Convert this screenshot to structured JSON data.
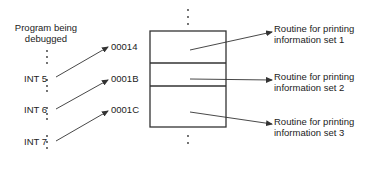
{
  "diagram": {
    "program_label": [
      "Program being",
      "debugged"
    ],
    "interrupts": [
      {
        "label": "INT 5",
        "vector_address": "00014",
        "routine": [
          "Routine for printing",
          "information set 1"
        ]
      },
      {
        "label": "INT 6",
        "vector_address": "0001B",
        "routine": [
          "Routine for printing",
          "information set 2"
        ]
      },
      {
        "label": "INT 7",
        "vector_address": "0001C",
        "routine": [
          "Routine for printing",
          "information set 3"
        ]
      }
    ],
    "ellipsis": "⋮",
    "line_color": "#333333",
    "text_color": "#222222"
  }
}
